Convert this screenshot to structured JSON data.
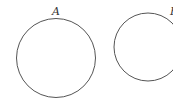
{
  "diagram": {
    "circles": [
      {
        "label": "A",
        "cx": 56,
        "cy": 58,
        "r": 40,
        "label_x": 56,
        "label_y": 15
      },
      {
        "label": "B",
        "cx": 148,
        "cy": 47,
        "r": 34,
        "label_x": 174,
        "label_y": 15
      }
    ],
    "stroke_color": "#555555"
  }
}
